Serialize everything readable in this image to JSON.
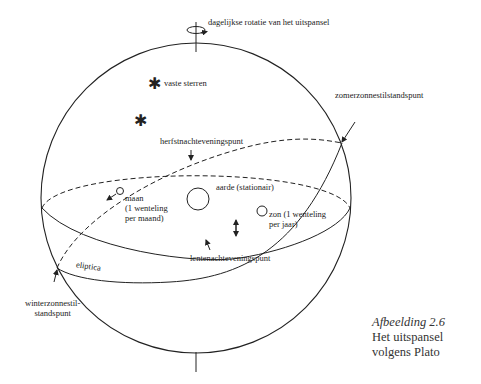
{
  "diagram": {
    "labels": {
      "rotation": "dagelijkse rotatie van het uitspansel",
      "fixed_stars": "vaste sterren",
      "summer_solstice": "zomerzonnestilstandspunt",
      "autumn_equinox": "herfstnachteveningspunt",
      "earth": "aarde (stationair)",
      "moon_line1": "maan",
      "moon_line2": "(1 wenteling",
      "moon_line3": "per maand)",
      "sun_line1": "zon (1 wenteling",
      "sun_line2": "per jaar)",
      "spring_equinox": "lentenachteveningspunt",
      "ecliptic": "eliptica",
      "winter_solstice_line1": "winterzonnestil-",
      "winter_solstice_line2": "standspunt"
    },
    "caption": {
      "title": "Afbeelding 2.6",
      "line1": "Het uitspansel",
      "line2": "volgens Plato"
    },
    "colors": {
      "stroke": "#222222",
      "background": "#ffffff"
    }
  }
}
